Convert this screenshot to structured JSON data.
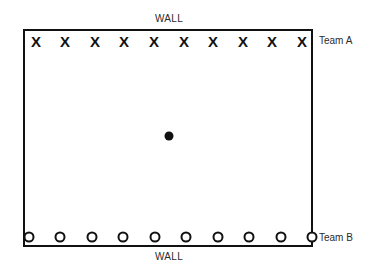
{
  "diagram": {
    "walls": {
      "top_label": "WALL",
      "bottom_label": "WALL"
    },
    "field": {
      "border_color": "#111111",
      "fill_color": "#ffffff",
      "border_width_px": 2
    },
    "teams": [
      {
        "id": "team-a",
        "label": "Team A",
        "marker": "X",
        "marker_name": "x-marker",
        "count": 10,
        "position": "top",
        "color": "#111111",
        "x_positions": [
          36,
          65,
          95,
          124,
          154,
          184,
          213,
          243,
          272,
          302
        ],
        "y_position": 41
      },
      {
        "id": "team-b",
        "label": "Team B",
        "marker": "O",
        "marker_name": "o-marker",
        "count": 10,
        "position": "bottom",
        "color": "#111111",
        "x_positions": [
          29,
          60,
          92,
          123,
          155,
          186,
          218,
          249,
          281,
          312
        ],
        "y_position": 237
      }
    ],
    "ball": {
      "label": "ball",
      "color": "#111111",
      "x": 169,
      "y": 136,
      "diameter_px": 9
    }
  }
}
